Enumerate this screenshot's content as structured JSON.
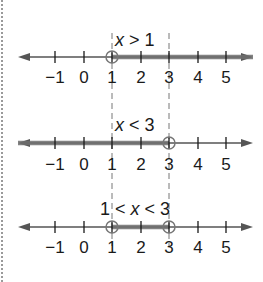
{
  "colors": {
    "axis": "#555555",
    "shade": "#6e6e6e",
    "text": "#1a1a1a",
    "guide": "#777777",
    "circle": "#777777"
  },
  "ticks": [
    {
      "value": -1,
      "label": "−1",
      "x": 55
    },
    {
      "value": 0,
      "label": "0",
      "x": 84
    },
    {
      "value": 1,
      "label": "1",
      "x": 112
    },
    {
      "value": 2,
      "label": "2",
      "x": 141
    },
    {
      "value": 3,
      "label": "3",
      "x": 169
    },
    {
      "value": 4,
      "label": "4",
      "x": 198
    },
    {
      "value": 5,
      "label": "5",
      "x": 226
    }
  ],
  "guides": {
    "x": [
      112,
      169
    ],
    "y_top": 33,
    "y_bottom": 246
  },
  "number_lines": [
    {
      "name": "x-greater-than-1",
      "label_parts": [
        {
          "t": "x",
          "italic": true
        },
        {
          "t": " > 1",
          "italic": false
        }
      ],
      "label_x": 115,
      "axis_y": 57,
      "label_y": 46,
      "tick_label_y": 83,
      "shade_from": 112,
      "shade_to": 253,
      "open_circles": [
        112
      ]
    },
    {
      "name": "x-less-than-3",
      "label_parts": [
        {
          "t": "x",
          "italic": true
        },
        {
          "t": " < 3",
          "italic": false
        }
      ],
      "label_x": 115,
      "axis_y": 143,
      "label_y": 131,
      "tick_label_y": 170,
      "shade_from": 18,
      "shade_to": 169,
      "open_circles": [
        169
      ]
    },
    {
      "name": "x-between-1-and-3",
      "label_parts": [
        {
          "t": "1 < ",
          "italic": false
        },
        {
          "t": "x",
          "italic": true
        },
        {
          "t": " < 3",
          "italic": false
        }
      ],
      "label_x": 100,
      "axis_y": 227,
      "label_y": 215,
      "tick_label_y": 253,
      "shade_from": 112,
      "shade_to": 169,
      "open_circles": [
        112,
        169
      ]
    }
  ],
  "axis_extent": {
    "x_left": 18,
    "x_right": 253
  }
}
